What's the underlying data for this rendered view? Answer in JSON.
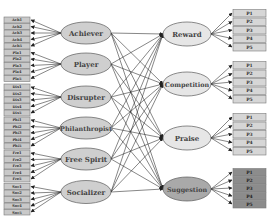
{
  "diagram": {
    "player_types": [
      {
        "label": "Achiever",
        "items": [
          "Ach1",
          "Ach2",
          "Ach3",
          "Ach4",
          "Ach5"
        ]
      },
      {
        "label": "Player",
        "items": [
          "Pla1",
          "Pla2",
          "Pla3",
          "Pla4",
          "Pla5"
        ]
      },
      {
        "label": "Disrupter",
        "items": [
          "Dis1",
          "Dis2",
          "Dis3",
          "Dis4",
          "Dis5"
        ]
      },
      {
        "label": "Philanthropist",
        "items": [
          "Phi1",
          "Phi2",
          "Phi3",
          "Phi4",
          "Phi5"
        ]
      },
      {
        "label": "Free Spirit",
        "items": [
          "Fre1",
          "Fre2",
          "Fre3",
          "Fre4",
          "Fre5"
        ]
      },
      {
        "label": "Socializer",
        "items": [
          "Soc1",
          "Soc2",
          "Soc3",
          "Soc4",
          "Soc5"
        ]
      }
    ],
    "strategies": [
      {
        "label": "Reward",
        "items": [
          "P1",
          "P2",
          "P3",
          "P4",
          "P5"
        ]
      },
      {
        "label": "Competition",
        "items": [
          "P1",
          "P2",
          "P3",
          "P4",
          "P5"
        ]
      },
      {
        "label": "Praise",
        "items": [
          "P1",
          "P2",
          "P3",
          "P4",
          "P5"
        ]
      },
      {
        "label": "Suggestion",
        "items": [
          "P1",
          "P2",
          "P3",
          "P4",
          "P5"
        ]
      }
    ],
    "colors": {
      "ellipse_fill": "#cfcfcf",
      "strategy_fill": "#e6e6e6",
      "suggestion_fill": "#a9a9a9",
      "box_fill": "#c9c9c9",
      "suggestion_box_fill": "#8c8c8c",
      "line": "#222222"
    }
  }
}
